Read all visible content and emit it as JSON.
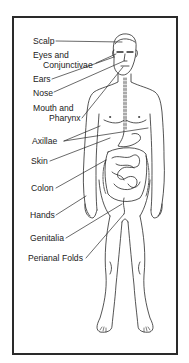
{
  "diagram": {
    "type": "anatomical-label-diagram",
    "line_color": "#2a2a2a",
    "background": "#ffffff",
    "labels": [
      {
        "id": "scalp",
        "text": "Scalp"
      },
      {
        "id": "eyes1",
        "text": "Eyes and"
      },
      {
        "id": "eyes2",
        "text": "Conjunctivae"
      },
      {
        "id": "ears",
        "text": "Ears"
      },
      {
        "id": "nose",
        "text": "Nose"
      },
      {
        "id": "mouth1",
        "text": "Mouth and"
      },
      {
        "id": "mouth2",
        "text": "Pharynx"
      },
      {
        "id": "axillae",
        "text": "Axillae"
      },
      {
        "id": "skin",
        "text": "Skin"
      },
      {
        "id": "colon",
        "text": "Colon"
      },
      {
        "id": "hands",
        "text": "Hands"
      },
      {
        "id": "genitalia",
        "text": "Genitalia"
      },
      {
        "id": "perianal",
        "text": "Perianal Folds"
      }
    ]
  }
}
